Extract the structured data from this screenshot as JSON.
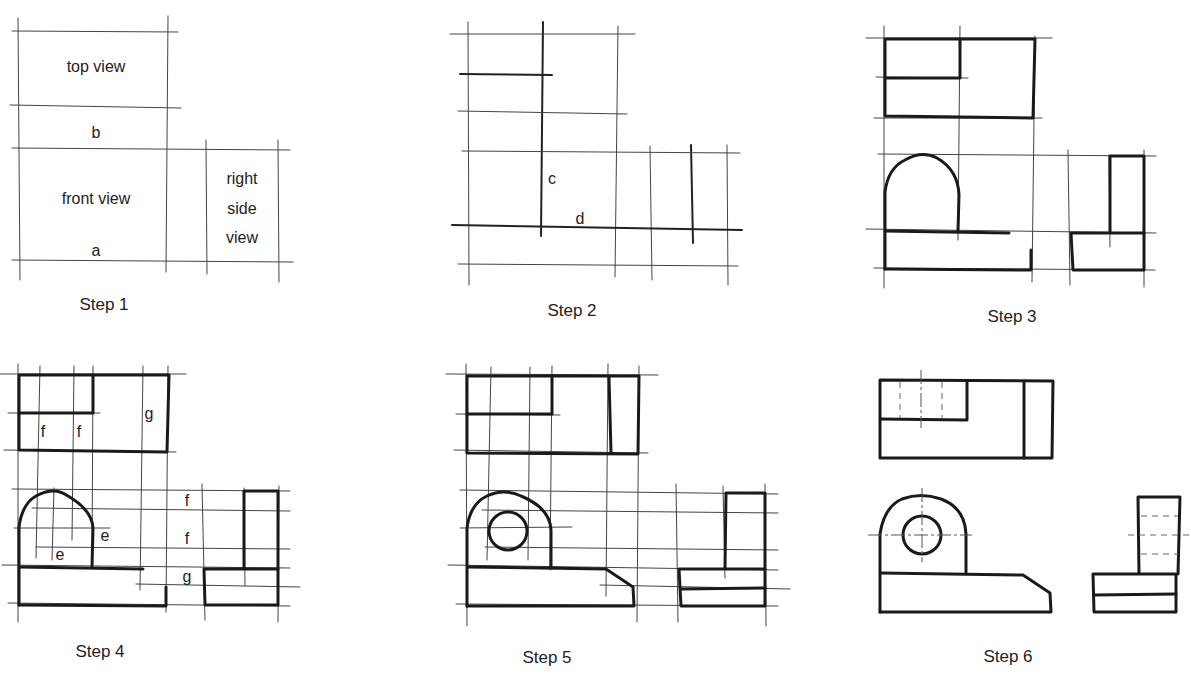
{
  "figure": {
    "steps": [
      {
        "caption": "Step 1",
        "labels": {
          "top_view": "top view",
          "front_view": "front view",
          "right_side_1": "right",
          "right_side_2": "side",
          "right_side_3": "view",
          "a": "a",
          "b": "b"
        }
      },
      {
        "caption": "Step 2",
        "labels": {
          "c": "c",
          "d": "d"
        }
      },
      {
        "caption": "Step 3",
        "labels": {}
      },
      {
        "caption": "Step 4",
        "labels": {
          "f_top_1": "f",
          "f_top_2": "f",
          "g_top": "g",
          "e_1": "e",
          "e_2": "e",
          "f_mid_1": "f",
          "f_mid_2": "f",
          "g_mid": "g"
        }
      },
      {
        "caption": "Step 5",
        "labels": {}
      },
      {
        "caption": "Step 6",
        "labels": {}
      }
    ]
  },
  "colors": {
    "ink": "#1a1a1a",
    "construction": "#444444",
    "background": "#ffffff"
  }
}
